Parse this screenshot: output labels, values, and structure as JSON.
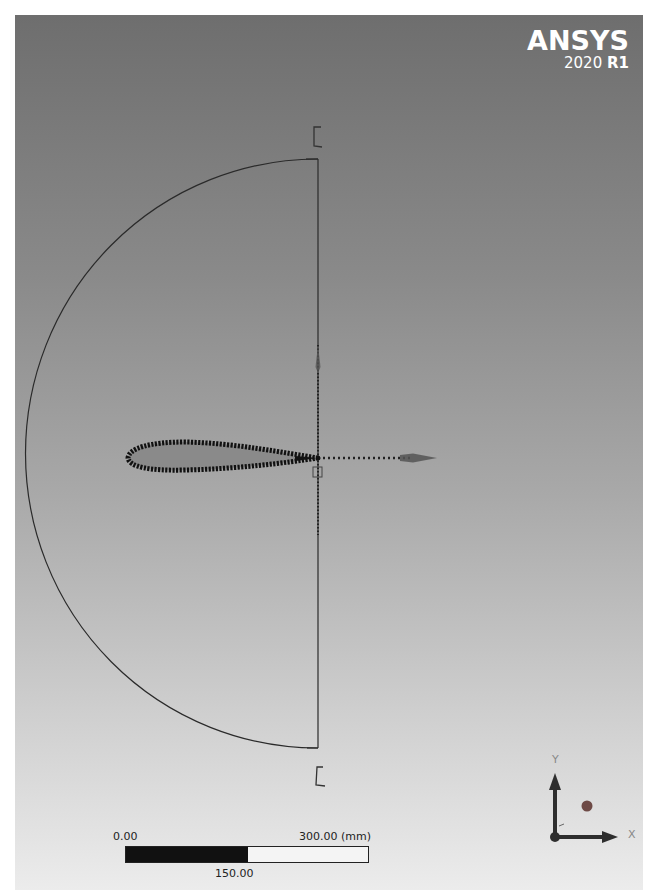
{
  "app": {
    "brand": "ANSYS",
    "version_year": "2020",
    "version_release": "R1"
  },
  "viewport": {
    "background_top": "#6e6e6e",
    "background_bottom": "#ececec",
    "geometry": {
      "description": "Half-circle C-mesh domain with airfoil at origin",
      "arc_center": [
        303,
        438
      ],
      "arc_radius": 293,
      "airfoil": {
        "leading_edge": [
          113,
          443
        ],
        "trailing_edge": [
          303,
          443
        ],
        "color": "#111111"
      }
    },
    "triad": {
      "x_label": "X",
      "y_label": "Y",
      "z_label": "Z",
      "color": "#333333",
      "point_color": "#7a4a44"
    }
  },
  "scale_bar": {
    "start_label": "0.00",
    "mid_label": "150.00",
    "end_label": "300.00 (mm)"
  }
}
